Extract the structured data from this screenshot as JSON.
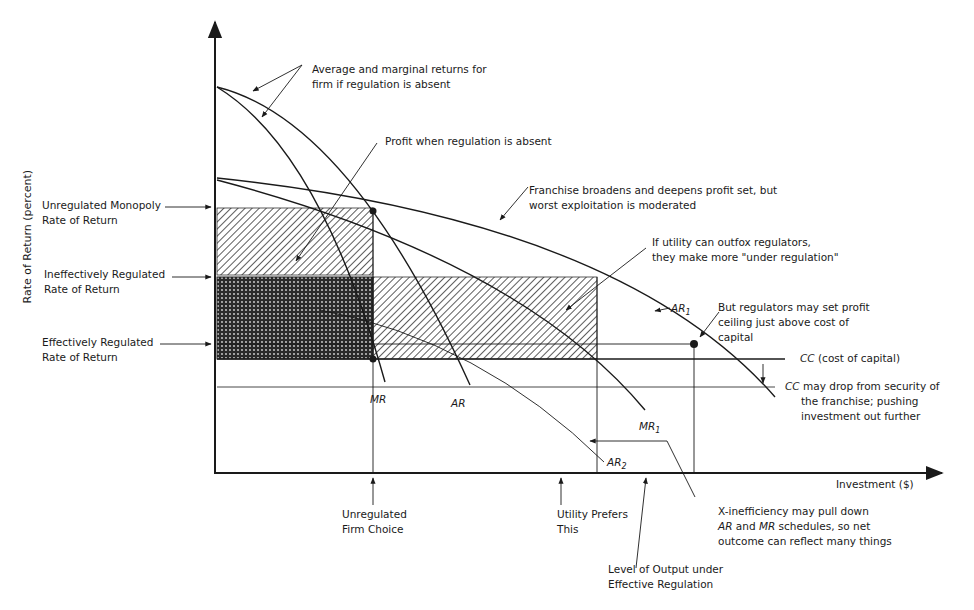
{
  "diagram": {
    "y_axis_label": "Rate of Return (percent)",
    "x_axis_label": "Investment ($)",
    "rate_levels": [
      {
        "line1": "Unregulated Monopoly",
        "line2": "Rate of Return"
      },
      {
        "line1": "Ineffectively Regulated",
        "line2": "Rate of Return"
      },
      {
        "line1": "Effectively Regulated",
        "line2": "Rate of Return"
      }
    ],
    "curve_labels": {
      "mr": "MR",
      "ar": "AR",
      "mr1_base": "MR",
      "mr1_sub": "1",
      "ar1_base": "AR",
      "ar1_sub": "1",
      "ar2_base": "AR",
      "ar2_sub": "2",
      "cc": "CC",
      "cc_desc": "(cost of capital)",
      "cc2": "CC"
    },
    "annotations": {
      "avg_marginal": {
        "line1": "Average and marginal returns for",
        "line2": "firm if regulation is absent"
      },
      "profit_absent": "Profit when regulation is absent",
      "franchise": {
        "line1": "Franchise broadens and deepens profit set, but",
        "line2": "worst exploitation is moderated"
      },
      "outfox": {
        "line1": "If utility can outfox regulators,",
        "line2": "they make more \"under regulation\""
      },
      "ceiling": {
        "line1": "But regulators may set profit",
        "line2": "ceiling just above cost of",
        "line3": "capital"
      },
      "cc_drop": {
        "line1": "may drop from security of",
        "line2": "the franchise; pushing",
        "line3": "investment out further"
      },
      "x_inefficiency": {
        "line1": "X-inefficiency may pull down",
        "line2_ar": "AR",
        "line2_and": " and ",
        "line2_mr": "MR",
        "line2_rest": " schedules, so net",
        "line3": "outcome can reflect many things"
      }
    },
    "x_markers": {
      "unregulated": {
        "line1": "Unregulated",
        "line2": "Firm Choice"
      },
      "utility_prefers": {
        "line1": "Utility Prefers",
        "line2": "This"
      },
      "effective": {
        "line1": "Level of Output under",
        "line2": "Effective Regulation"
      }
    },
    "colors": {
      "ink": "#1a1a1a",
      "background": "#ffffff"
    }
  }
}
